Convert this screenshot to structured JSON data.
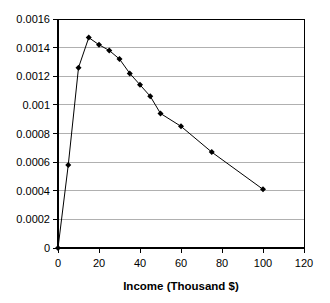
{
  "chart_data": {
    "type": "line",
    "title": "",
    "subtitle": "",
    "xlabel": "Income   (Thousand $)",
    "ylabel": "",
    "xlim": [
      0,
      120
    ],
    "ylim": [
      0,
      0.0016
    ],
    "xticks": [
      "0",
      "20",
      "40",
      "60",
      "80",
      "100",
      "120"
    ],
    "xtick_values": [
      0,
      20,
      40,
      60,
      80,
      100,
      120
    ],
    "yticks": [
      "0",
      "0.0002",
      "0.0004",
      "0.0006",
      "0.0008",
      "0.001",
      "0.0012",
      "0.0014",
      "0.0016"
    ],
    "ytick_values": [
      0,
      0.0002,
      0.0004,
      0.0006,
      0.0008,
      0.001,
      0.0012,
      0.0014,
      0.0016
    ],
    "grid": "horizontal",
    "legend": "none",
    "marker": "diamond",
    "marker_color": "#000000",
    "line_color": "#000000",
    "border_color": "#000000",
    "gridline_color": "#b0b0b0",
    "x": [
      0,
      5,
      10,
      15,
      20,
      25,
      30,
      35,
      40,
      45,
      50,
      60,
      75,
      100
    ],
    "values": [
      0,
      0.00058,
      0.00126,
      0.00147,
      0.00142,
      0.00138,
      0.00132,
      0.00122,
      0.00114,
      0.00106,
      0.00094,
      0.00085,
      0.00067,
      0.00041
    ],
    "series": [
      {
        "name": "Income distribution",
        "x": [
          0,
          5,
          10,
          15,
          20,
          25,
          30,
          35,
          40,
          45,
          50,
          60,
          75,
          100
        ],
        "values": [
          0,
          0.00058,
          0.00126,
          0.00147,
          0.00142,
          0.00138,
          0.00132,
          0.00122,
          0.00114,
          0.00106,
          0.00094,
          0.00085,
          0.00067,
          0.00041
        ]
      }
    ]
  },
  "axes": {
    "x_title": "Income   (Thousand $)",
    "x_tick_0": "0",
    "x_tick_1": "20",
    "x_tick_2": "40",
    "x_tick_3": "60",
    "x_tick_4": "80",
    "x_tick_5": "100",
    "x_tick_6": "120",
    "y_tick_0": "0",
    "y_tick_1": "0.0002",
    "y_tick_2": "0.0004",
    "y_tick_3": "0.0006",
    "y_tick_4": "0.0008",
    "y_tick_5": "0.001",
    "y_tick_6": "0.0012",
    "y_tick_7": "0.0014",
    "y_tick_8": "0.0016"
  }
}
